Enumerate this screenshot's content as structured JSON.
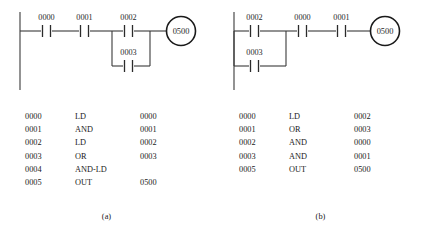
{
  "figure": {
    "panels": [
      {
        "id": "a",
        "caption": "(a)",
        "ladder": {
          "coil": "0500",
          "series_contacts_before_branch": [
            "0000",
            "0001"
          ],
          "branch_contacts": [
            "0002",
            "0003"
          ],
          "series_contacts_after_branch": []
        },
        "instructions": {
          "rows": [
            {
              "address": "0000",
              "operation": "LD",
              "operand": "0000"
            },
            {
              "address": "0001",
              "operation": "AND",
              "operand": "0001"
            },
            {
              "address": "0002",
              "operation": "LD",
              "operand": "0002"
            },
            {
              "address": "0003",
              "operation": "OR",
              "operand": "0003"
            },
            {
              "address": "0004",
              "operation": "AND-LD",
              "operand": ""
            },
            {
              "address": "0005",
              "operation": "OUT",
              "operand": "0500"
            }
          ]
        }
      },
      {
        "id": "b",
        "caption": "(b)",
        "ladder": {
          "coil": "0500",
          "series_contacts_before_branch": [],
          "branch_contacts": [
            "0002",
            "0003"
          ],
          "series_contacts_after_branch": [
            "0000",
            "0001"
          ]
        },
        "instructions": {
          "rows": [
            {
              "address": "0000",
              "operation": "LD",
              "operand": "0002"
            },
            {
              "address": "0001",
              "operation": "OR",
              "operand": "0003"
            },
            {
              "address": "0002",
              "operation": "AND",
              "operand": "0000"
            },
            {
              "address": "0003",
              "operation": "AND",
              "operand": "0001"
            },
            {
              "address": "0005",
              "operation": "OUT",
              "operand": "0500"
            }
          ]
        }
      }
    ]
  },
  "colors": {
    "background": "#ffffff",
    "line": "#3a3a3a",
    "text": "#2a2a2a"
  }
}
